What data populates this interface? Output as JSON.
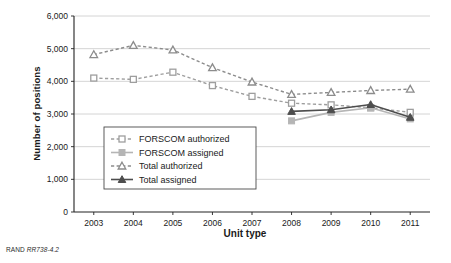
{
  "figure": {
    "source_note_prefix": "RAND ",
    "source_note_id": "RR738-4.2"
  },
  "chart_data": {
    "type": "line",
    "title": "",
    "xlabel": "Unit type",
    "ylabel": "Number of positions",
    "categories": [
      "2003",
      "2004",
      "2005",
      "2006",
      "2007",
      "2008",
      "2009",
      "2010",
      "2011"
    ],
    "ylim": [
      0,
      6000
    ],
    "yticks": [
      0,
      1000,
      2000,
      3000,
      4000,
      5000,
      6000
    ],
    "ytick_labels": [
      "0",
      "1,000",
      "2,000",
      "3,000",
      "4,000",
      "5,000",
      "6,000"
    ],
    "grid": "horizontal",
    "legend_position": "inside-lower-left",
    "series": [
      {
        "name": "FORSCOM authorized",
        "color": "#9e9e9e",
        "style": "dashed",
        "marker": "square-open",
        "x": [
          "2003",
          "2004",
          "2005",
          "2006",
          "2007",
          "2008",
          "2009",
          "2010",
          "2011"
        ],
        "values": [
          4100,
          4060,
          4280,
          3870,
          3540,
          3330,
          3280,
          3190,
          3050
        ]
      },
      {
        "name": "FORSCOM assigned",
        "color": "#b5b5b5",
        "style": "solid",
        "marker": "square-filled",
        "x": [
          "2008",
          "2009",
          "2010",
          "2011"
        ],
        "values": [
          2790,
          3050,
          3190,
          2850
        ]
      },
      {
        "name": "Total authorized",
        "color": "#8c8c8c",
        "style": "dashed",
        "marker": "triangle-open",
        "x": [
          "2003",
          "2004",
          "2005",
          "2006",
          "2007",
          "2008",
          "2009",
          "2010",
          "2011"
        ],
        "values": [
          4820,
          5100,
          4960,
          4420,
          3980,
          3600,
          3660,
          3720,
          3760
        ]
      },
      {
        "name": "Total assigned",
        "color": "#4d4d4d",
        "style": "solid",
        "marker": "triangle-filled",
        "x": [
          "2008",
          "2009",
          "2010",
          "2011"
        ],
        "values": [
          3080,
          3130,
          3290,
          2900
        ]
      }
    ]
  }
}
